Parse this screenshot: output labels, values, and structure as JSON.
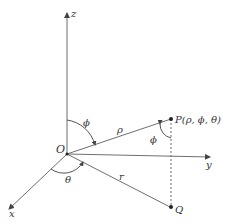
{
  "diagram": {
    "labels": {
      "z_axis": "z",
      "y_axis": "y",
      "x_axis": "x",
      "origin": "O",
      "point_p": "P(ρ, ϕ, θ)",
      "point_q": "Q",
      "rho": "ρ",
      "r": "r",
      "phi_top": "ϕ",
      "phi_at_p": "ϕ",
      "theta": "θ"
    },
    "colors": {
      "line": "#6f6f6f",
      "text": "#333333",
      "point": "#222222"
    }
  }
}
